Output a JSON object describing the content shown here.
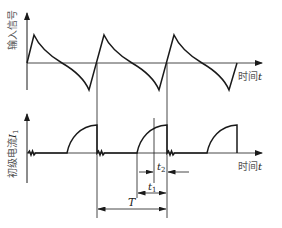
{
  "diagram": {
    "type": "waveform-timing-diagram",
    "colors": {
      "line": "#1a1a1a",
      "label": "#555555",
      "background": "#ffffff"
    },
    "top_graph": {
      "y_label": "输入信号",
      "x_label_cn": "时间",
      "x_label_var": "t",
      "waveform": "periodic sawtooth-like: fast rise to positive peak, curved decay crossing zero to negative trough, fast rise back",
      "periods_shown": 3
    },
    "bottom_graph": {
      "y_label_cn": "初级电流",
      "y_label_var": "I",
      "y_label_sub": "1",
      "x_label_cn": "时间",
      "x_label_var": "t",
      "waveform": "periodic pulses: flat baseline with small ripple, quarter-arc rise to plateau, sharp drop",
      "pulses_shown": 3
    },
    "annotations": {
      "t2": {
        "var": "t",
        "sub": "2"
      },
      "t1": {
        "var": "t",
        "sub": "1"
      },
      "T": {
        "var": "T"
      }
    }
  }
}
